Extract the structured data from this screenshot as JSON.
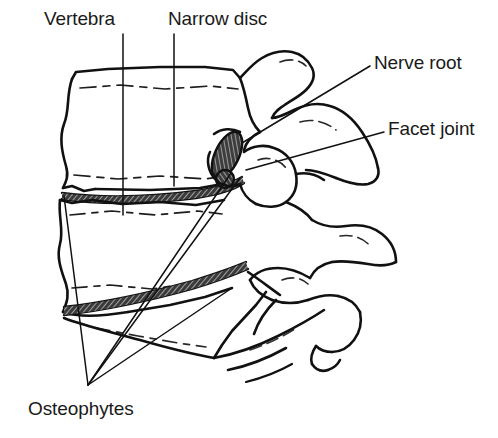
{
  "figure": {
    "background_color": "#ffffff",
    "ink_color": "#111111",
    "hatch_color": "#555555"
  },
  "labels": {
    "vertebra": "Vertebra",
    "narrow_disc": "Narrow disc",
    "nerve_root": "Nerve root",
    "facet_joint": "Facet joint",
    "osteophytes": "Osteophytes"
  },
  "annotations": [
    {
      "id": "vertebra",
      "text": "Vertebra",
      "leader": "vertical-line",
      "leader_from": [
        123,
        34
      ],
      "leader_to": [
        123,
        215
      ]
    },
    {
      "id": "narrow-disc",
      "text": "Narrow disc",
      "leader": "vertical-line",
      "leader_from": [
        174,
        34
      ],
      "leader_to": [
        174,
        186
      ]
    },
    {
      "id": "nerve-root",
      "text": "Nerve root",
      "leader": "diagonal-line",
      "leader_from": [
        370,
        66
      ],
      "leader_to": [
        242,
        143
      ]
    },
    {
      "id": "facet-joint",
      "text": "Facet joint",
      "leader": "diagonal-line",
      "leader_from": [
        384,
        132
      ],
      "leader_to": [
        246,
        170
      ]
    },
    {
      "id": "osteophytes",
      "text": "Osteophytes",
      "leader": "two-converging-lines",
      "apex": [
        88,
        385
      ],
      "targets": [
        [
          231,
          173
        ],
        [
          240,
          178
        ]
      ]
    }
  ],
  "structures": [
    {
      "id": "upper-vertebral-body",
      "name": "Upper vertebral body",
      "shaded": false
    },
    {
      "id": "lower-vertebral-body",
      "name": "Lower vertebral body",
      "shaded": false
    },
    {
      "id": "upper-narrow-disc",
      "name": "Narrowed intervertebral disc with osteophyte",
      "shaded": true
    },
    {
      "id": "lower-narrow-disc",
      "name": "Narrowed intervertebral disc with osteophyte",
      "shaded": true
    },
    {
      "id": "nerve-root-oval",
      "name": "Compressed nerve root",
      "shaded": true
    },
    {
      "id": "facet-joint-surface",
      "name": "Facet joint articulation",
      "shaded": false
    },
    {
      "id": "spinous-process-upper",
      "name": "Upper spinous process",
      "shaded": false
    },
    {
      "id": "spinous-process-lower",
      "name": "Lower spinous process",
      "shaded": false
    },
    {
      "id": "transverse-process",
      "name": "Transverse process",
      "shaded": false
    }
  ]
}
